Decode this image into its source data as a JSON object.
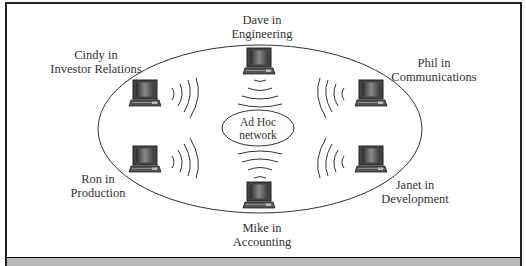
{
  "diagram": {
    "title": "Ad Hoc network",
    "center": {
      "line1": "Ad Hoc",
      "line2": "network"
    },
    "nodes": [
      {
        "id": "dave",
        "line1": "Dave in",
        "line2": "Engineering"
      },
      {
        "id": "cindy",
        "line1": "Cindy in",
        "line2": "Investor Relations"
      },
      {
        "id": "phil",
        "line1": "Phil in",
        "line2": "Communications"
      },
      {
        "id": "ron",
        "line1": "Ron in",
        "line2": "Production"
      },
      {
        "id": "janet",
        "line1": "Janet in",
        "line2": "Development"
      },
      {
        "id": "mike",
        "line1": "Mike in",
        "line2": "Accounting"
      }
    ],
    "icons": {
      "node": "laptop-icon",
      "signal": "wireless-waves-icon"
    },
    "colors": {
      "line": "#333333",
      "text": "#333333",
      "band": "#b8b8b8",
      "frame": "#222222"
    }
  }
}
